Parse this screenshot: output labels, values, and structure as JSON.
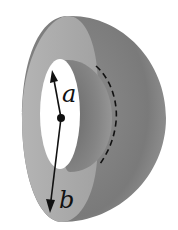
{
  "diagram": {
    "labels": {
      "inner_radius": "a",
      "outer_radius": "b"
    },
    "colors": {
      "background": "#ffffff",
      "cut_face": "#aaaaaa",
      "outer_surface": "#7c7c7c",
      "inner_cavity": "#8a8a8a",
      "hole": "#ffffff",
      "ink": "#111111"
    }
  }
}
